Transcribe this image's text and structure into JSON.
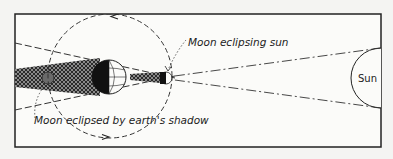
{
  "diagram": {
    "labels": {
      "moon_eclipsing_sun": "Moon eclipsing sun",
      "moon_eclipsed": "Moon eclipsed by earth's shadow",
      "sun": "Sun"
    },
    "elements": [
      "sun",
      "earth",
      "earth-shadow-umbra",
      "moon-orbit",
      "moon-shadow",
      "moon-new",
      "moon-full"
    ],
    "colors": {
      "background": "#f4f4f2",
      "ink": "#222222",
      "shadow": "#3a3a3a"
    }
  }
}
